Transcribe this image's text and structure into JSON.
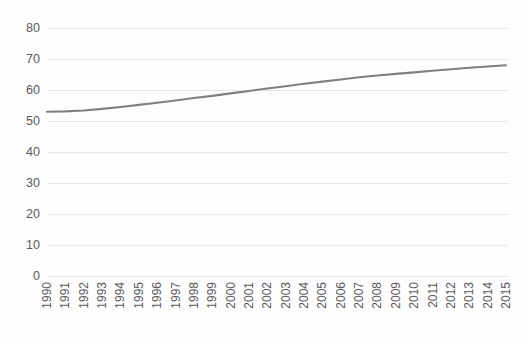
{
  "chart_data": {
    "type": "line",
    "title": "",
    "subtitle": "",
    "xlabel": "",
    "ylabel": "",
    "grid": "horizontal",
    "legend": "none",
    "line_color": "#808080",
    "gridline_color": "#e8e8e8",
    "tick_label_color": "#5a5a5a",
    "background_color": "#ffffff",
    "ylim": [
      0,
      80
    ],
    "yticks": [
      0,
      10,
      20,
      30,
      40,
      50,
      60,
      70,
      80
    ],
    "ytick_labels": [
      "0",
      "10",
      "20",
      "30",
      "40",
      "50",
      "60",
      "70",
      "80"
    ],
    "x_tick_rotation": 90,
    "categories": [
      "1990",
      "1991",
      "1992",
      "1993",
      "1994",
      "1995",
      "1996",
      "1997",
      "1998",
      "1999",
      "2000",
      "2001",
      "2002",
      "2003",
      "2004",
      "2005",
      "2006",
      "2007",
      "2008",
      "2009",
      "2010",
      "2011",
      "2012",
      "2013",
      "2014",
      "2015"
    ],
    "series": [
      {
        "name": "series-1",
        "values": [
          53.0,
          53.1,
          53.4,
          53.9,
          54.5,
          55.2,
          55.9,
          56.6,
          57.4,
          58.1,
          58.9,
          59.7,
          60.5,
          61.2,
          62.0,
          62.7,
          63.4,
          64.1,
          64.7,
          65.2,
          65.7,
          66.2,
          66.7,
          67.2,
          67.6,
          68.0
        ]
      }
    ]
  }
}
